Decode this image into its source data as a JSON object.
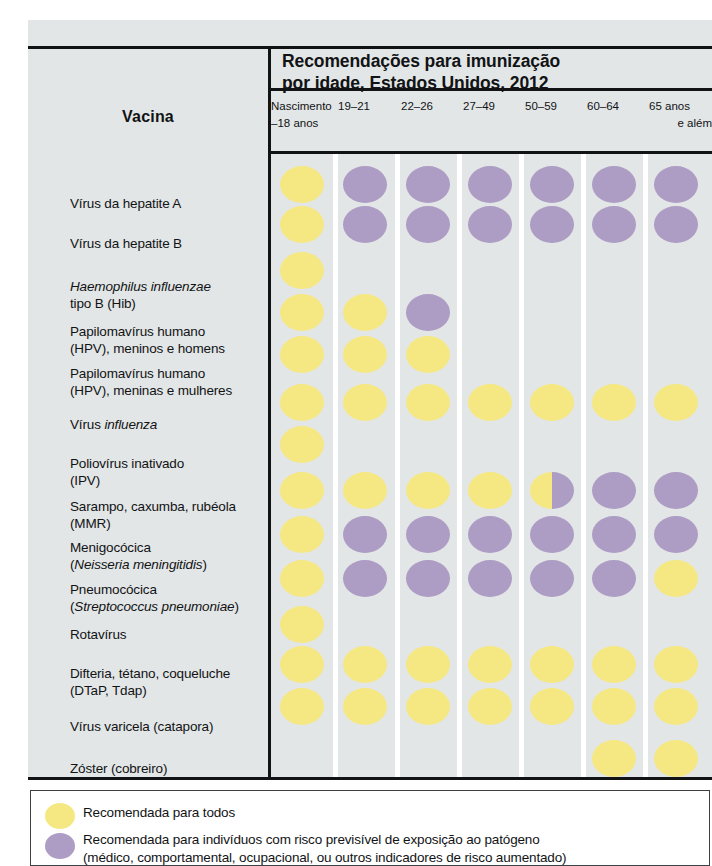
{
  "table": {
    "row_header_label": "Vacina",
    "title_line1": "Recomendações para imunização",
    "title_line2": "por idade, Estados Unidos, 2012",
    "columns": [
      {
        "line1": "Nascimento",
        "line2": "–18 anos"
      },
      {
        "line1": "19–21",
        "line2": ""
      },
      {
        "line1": "22–26",
        "line2": ""
      },
      {
        "line1": "27–49",
        "line2": ""
      },
      {
        "line1": "50–59",
        "line2": ""
      },
      {
        "line1": "60–64",
        "line2": ""
      },
      {
        "line1": "65 anos",
        "line2": "e além"
      }
    ],
    "rows": [
      {
        "label_html": "Vírus da hepatite A",
        "cells": [
          "yellow",
          "purple",
          "purple",
          "purple",
          "purple",
          "purple",
          "purple"
        ]
      },
      {
        "label_html": "Vírus da hepatite B",
        "cells": [
          "yellow",
          "purple",
          "purple",
          "purple",
          "purple",
          "purple",
          "purple"
        ]
      },
      {
        "label_html": "<i>Haemophilus influenzae</i><br>tipo B (Hib)",
        "cells": [
          "yellow",
          "",
          "",
          "",
          "",
          "",
          ""
        ]
      },
      {
        "label_html": "Papilomavírus humano<br>(HPV), meninos e homens",
        "cells": [
          "yellow",
          "yellow",
          "purple",
          "",
          "",
          "",
          ""
        ]
      },
      {
        "label_html": "Papilomavírus humano<br>(HPV), meninas e mulheres",
        "cells": [
          "yellow",
          "yellow",
          "yellow",
          "",
          "",
          "",
          ""
        ]
      },
      {
        "label_html": "Vírus <i>influenza</i>",
        "cells": [
          "yellow",
          "yellow",
          "yellow",
          "yellow",
          "yellow",
          "yellow",
          "yellow"
        ]
      },
      {
        "label_html": "Poliovírus inativado<br>(IPV)",
        "cells": [
          "yellow",
          "",
          "",
          "",
          "",
          "",
          ""
        ]
      },
      {
        "label_html": "Sarampo, caxumba, rubéola<br>(MMR)",
        "cells": [
          "yellow",
          "yellow",
          "yellow",
          "yellow",
          "half",
          "purple",
          "purple"
        ]
      },
      {
        "label_html": "Menigocócica<br>(<i>Neisseria meningitidis</i>)",
        "cells": [
          "yellow",
          "purple",
          "purple",
          "purple",
          "purple",
          "purple",
          "purple"
        ]
      },
      {
        "label_html": "Pneumocócica<br>(<i>Streptococcus pneumoniae</i>)",
        "cells": [
          "yellow",
          "purple",
          "purple",
          "purple",
          "purple",
          "purple",
          "yellow"
        ]
      },
      {
        "label_html": "Rotavírus",
        "cells": [
          "yellow",
          "",
          "",
          "",
          "",
          "",
          ""
        ]
      },
      {
        "label_html": "Difteria, tétano, coqueluche<br>(DTaP, Tdap)",
        "cells": [
          "yellow",
          "yellow",
          "yellow",
          "yellow",
          "yellow",
          "yellow",
          "yellow"
        ]
      },
      {
        "label_html": "Vírus varicela (catapora)",
        "cells": [
          "yellow",
          "yellow",
          "yellow",
          "yellow",
          "yellow",
          "yellow",
          "yellow"
        ]
      },
      {
        "label_html": "Zóster (cobreiro)",
        "cells": [
          "",
          "",
          "",
          "",
          "",
          "yellow",
          "yellow"
        ]
      }
    ]
  },
  "legend": {
    "items": [
      {
        "swatch": "yellow",
        "line1": "Recomendada para todos",
        "line2": ""
      },
      {
        "swatch": "purple",
        "line1": "Recomendada para indivíduos com risco previsível de exposição ao patógeno",
        "line2": "(médico, comportamental, ocupacional, ou outros indicadores de risco aumentado)"
      }
    ]
  },
  "colors": {
    "recommended_all": "#f5e882",
    "recommended_risk": "#ad9cc4",
    "panel_background": "#e3e6e6",
    "rule": "#111315",
    "text": "#111315"
  }
}
